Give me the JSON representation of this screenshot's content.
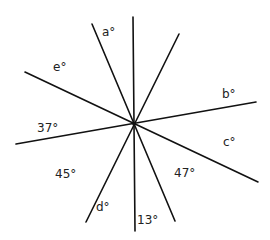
{
  "diagram": {
    "type": "intersecting-lines-angles",
    "center": {
      "x": 134,
      "y": 124
    },
    "lines": [
      {
        "id": "vertical",
        "x1": 133,
        "y1": 17,
        "x2": 135,
        "y2": 231
      },
      {
        "id": "steep-left",
        "x1": 92,
        "y1": 24,
        "x2": 175,
        "y2": 221
      },
      {
        "id": "steep-right",
        "x1": 179,
        "y1": 34,
        "x2": 86,
        "y2": 222
      },
      {
        "id": "shallow-down",
        "x1": 25,
        "y1": 72,
        "x2": 258,
        "y2": 182
      },
      {
        "id": "shallow-up",
        "x1": 16,
        "y1": 144,
        "x2": 256,
        "y2": 102
      }
    ],
    "labels": [
      {
        "id": "a",
        "text": "a°",
        "x": 102,
        "y": 36
      },
      {
        "id": "e",
        "text": "e°",
        "x": 53,
        "y": 71
      },
      {
        "id": "b",
        "text": "b°",
        "x": 222,
        "y": 98
      },
      {
        "id": "37",
        "text": "37°",
        "x": 37,
        "y": 132
      },
      {
        "id": "c",
        "text": "c°",
        "x": 223,
        "y": 146
      },
      {
        "id": "45",
        "text": "45°",
        "x": 55,
        "y": 178
      },
      {
        "id": "47",
        "text": "47°",
        "x": 174,
        "y": 177
      },
      {
        "id": "d",
        "text": "d°",
        "x": 96,
        "y": 211
      },
      {
        "id": "13",
        "text": "13°",
        "x": 137,
        "y": 224
      }
    ],
    "stroke_color": "#111111",
    "text_color": "#222222"
  }
}
